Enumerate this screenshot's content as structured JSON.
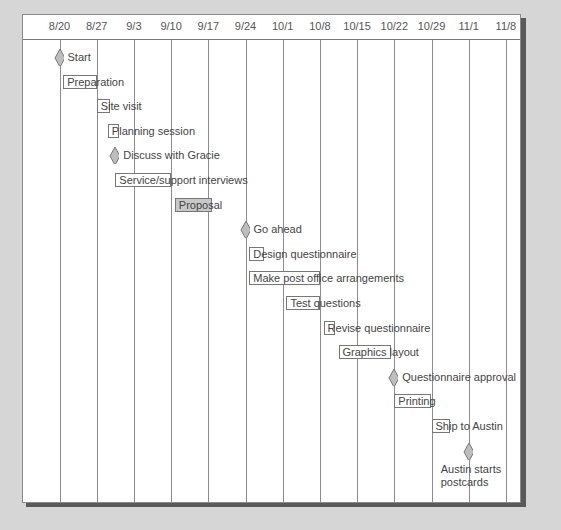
{
  "chart_data": {
    "type": "gantt",
    "title": "",
    "xlabel": "",
    "ylabel": "",
    "categories": [
      "8/20",
      "8/27",
      "9/3",
      "9/10",
      "9/17",
      "9/24",
      "10/1",
      "10/8",
      "10/15",
      "10/22",
      "10/29",
      "11/1",
      "11/8"
    ],
    "grid": true,
    "items": [
      {
        "label": "Start",
        "kind": "milestone",
        "at": 0.0
      },
      {
        "label": "Preparation",
        "kind": "task",
        "start": 0.1,
        "end": 1.0
      },
      {
        "label": "Site visit",
        "kind": "task",
        "start": 1.0,
        "end": 1.35
      },
      {
        "label": "Planning session",
        "kind": "task",
        "start": 1.3,
        "end": 1.6
      },
      {
        "label": "Discuss with Gracie",
        "kind": "milestone",
        "at": 1.5
      },
      {
        "label": "Service/support interviews",
        "kind": "task",
        "start": 1.5,
        "end": 3.0
      },
      {
        "label": "Proposal",
        "kind": "task",
        "start": 3.1,
        "end": 4.1,
        "highlight": true
      },
      {
        "label": "Go ahead",
        "kind": "milestone",
        "at": 5.0
      },
      {
        "label": "Design questionnaire",
        "kind": "task",
        "start": 5.1,
        "end": 5.5
      },
      {
        "label": "Make post office arrangements",
        "kind": "task",
        "start": 5.1,
        "end": 7.0
      },
      {
        "label": "Test questions",
        "kind": "task",
        "start": 6.1,
        "end": 7.0
      },
      {
        "label": "Revise questionnaire",
        "kind": "task",
        "start": 7.1,
        "end": 7.4
      },
      {
        "label": "Graphics layout",
        "kind": "task",
        "start": 7.5,
        "end": 8.9
      },
      {
        "label": "Questionnaire approval",
        "kind": "milestone",
        "at": 9.0
      },
      {
        "label": "Printing",
        "kind": "task",
        "start": 9.0,
        "end": 10.0
      },
      {
        "label": "Ship to Austin",
        "kind": "task",
        "start": 10.0,
        "end": 10.5
      },
      {
        "label": "Austin starts postcards",
        "kind": "milestone",
        "at": 11.0,
        "label_below": true
      }
    ]
  },
  "colors": {
    "background": "#d6d6d6",
    "panel": "#ffffff",
    "milestone_fill": "#bdbdbd",
    "highlight_fill": "#c8c8c8",
    "line": "#777777"
  }
}
